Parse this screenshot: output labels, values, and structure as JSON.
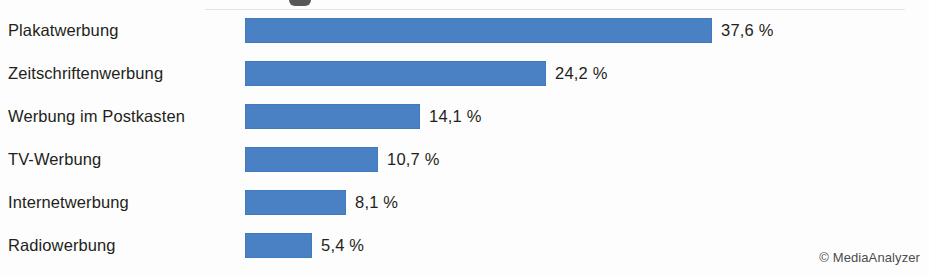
{
  "credit": "© MediaAnalyzer",
  "colors": {
    "bar": "#4a80c4",
    "bar_edge": "#3d72b5",
    "text": "#231f20",
    "credit_text": "#4d4d4d",
    "background": "#fdfdfd",
    "rule": "#cfdcec"
  },
  "chart_data": {
    "type": "bar",
    "orientation": "horizontal",
    "title": "",
    "xlabel": "",
    "ylabel": "",
    "xlim": [
      0,
      37.6
    ],
    "grid": false,
    "legend": false,
    "unit": "%",
    "categories": [
      "Plakatwerbung",
      "Zeitschriftenwerbung",
      "Werbung im Postkasten",
      "TV-Werbung",
      "Internetwerbung",
      "Radiowerbung"
    ],
    "values": [
      37.6,
      24.2,
      14.1,
      10.7,
      8.1,
      5.4
    ],
    "value_labels": [
      "37,6 %",
      "24,2 %",
      "14,1 %",
      "10,7 %",
      "8,1 %",
      "5,4 %"
    ]
  }
}
